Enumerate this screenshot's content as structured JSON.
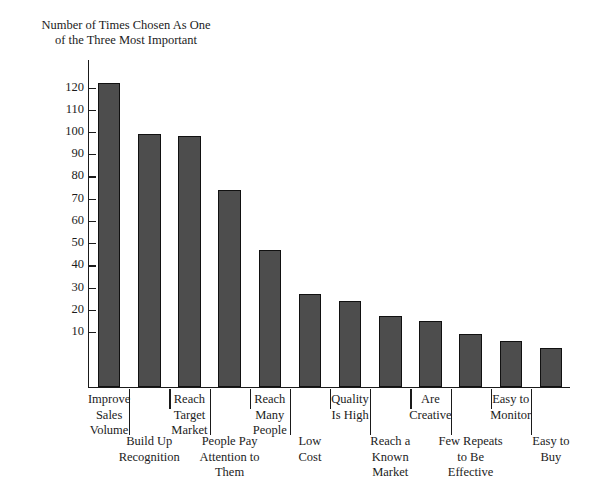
{
  "chart_data": {
    "type": "bar",
    "title": "",
    "ylabel": "Number of Times Chosen As One\nof the Three Most Important",
    "xlabel": "",
    "ylim": [
      0,
      127
    ],
    "grid": false,
    "legend": null,
    "bar_color": "#4d4d4d",
    "bar_edge_color": "#111111",
    "y_ticks": [
      120,
      110,
      100,
      90,
      80,
      70,
      60,
      50,
      40,
      30,
      20,
      10
    ],
    "y_tick_labels": [
      "120",
      "110",
      "100",
      "90",
      "80",
      "70",
      "60",
      "50",
      "40",
      "30",
      "20",
      "10"
    ],
    "categories": [
      "Improve\nSales\nVolume",
      "Build Up\nRecognition",
      "Reach\nTarget\nMarket",
      "People Pay\nAttention to\nThem",
      "Reach\nMany\nPeople",
      "Low\nCost",
      "Quality\nIs High",
      "Reach a\nKnown\nMarket",
      "Are\nCreative",
      "Few Repeats\nto Be\nEffective",
      "Easy to\nMonitor",
      "Easy to\nBuy"
    ],
    "values": [
      122,
      99,
      98,
      74,
      47,
      27,
      24,
      17,
      15,
      9,
      6,
      3
    ]
  },
  "layout": {
    "label_rows": [
      0,
      1,
      0,
      1,
      0,
      1,
      0,
      1,
      0,
      1,
      0,
      1
    ]
  }
}
